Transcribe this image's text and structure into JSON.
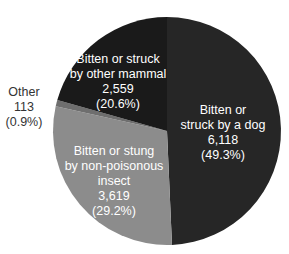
{
  "chart_data": {
    "type": "pie",
    "title": "",
    "start_angle_deg": 0,
    "direction": "clockwise",
    "slices": [
      {
        "label": "Bitten or struck by a dog",
        "value": 6118,
        "value_text": "6,118",
        "percent": 49.3,
        "percent_text": "(49.3%)",
        "color": "#262626"
      },
      {
        "label": "Bitten or stung by non-poisonous insect",
        "value": 3619,
        "value_text": "3,619",
        "percent": 29.2,
        "percent_text": "(29.2%)",
        "color": "#8c8c8c"
      },
      {
        "label": "Other",
        "value": 113,
        "value_text": "113",
        "percent": 0.9,
        "percent_text": "(0.9%)",
        "color": "#6e6e6e"
      },
      {
        "label": "Bitten or struck by other mammal",
        "value": 2559,
        "value_text": "2,559",
        "percent": 20.6,
        "percent_text": "(20.6%)",
        "color": "#1a1a1a"
      }
    ]
  },
  "labels": {
    "dog": {
      "line1": "Bitten or",
      "line2": "struck by a dog",
      "value": "6,118",
      "pct": "(49.3%)"
    },
    "insect": {
      "line1": "Bitten or stung",
      "line2": "by non-poisonous",
      "line3": "insect",
      "value": "3,619",
      "pct": "(29.2%)"
    },
    "other": {
      "line1": "Other",
      "value": "113",
      "pct": "(0.9%)"
    },
    "mammal": {
      "line1": "Bitten or struck",
      "line2": "by other mammal",
      "value": "2,559",
      "pct": "(20.6%)"
    }
  }
}
